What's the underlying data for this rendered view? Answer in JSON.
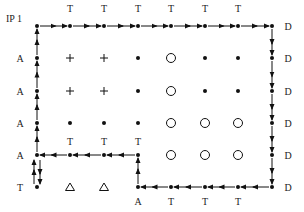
{
  "title_label": "IP 1",
  "grid": {
    "cols_x": [
      37,
      70,
      104,
      138,
      171,
      205,
      238,
      272
    ],
    "rows_y": [
      26,
      58,
      91,
      123,
      155,
      187
    ]
  },
  "colors": {
    "ink": "#111111",
    "background": "#ffffff"
  },
  "cells": [
    [
      "dot",
      "dot",
      "dot",
      "dot",
      "dot",
      "dot",
      "dot",
      "dot"
    ],
    [
      "dot",
      "plus",
      "plus",
      "dot",
      "circle",
      "dot",
      "dot",
      "dot"
    ],
    [
      "dot",
      "plus",
      "plus",
      "dot",
      "circle",
      "dot",
      "dot",
      "dot"
    ],
    [
      "dot",
      "dot",
      "dot",
      "dot",
      "circle",
      "circle",
      "circle",
      "dot"
    ],
    [
      "dot",
      "dot",
      "dot",
      "dot",
      "circle",
      "circle",
      "circle",
      "dot"
    ],
    [
      "dot",
      "triangle",
      "triangle",
      "dot",
      "dot",
      "dot",
      "dot",
      "dot"
    ]
  ],
  "labels": [
    {
      "text": "IP 1",
      "x": 6,
      "y": 22
    },
    {
      "text": "T",
      "x": 70,
      "y": 12
    },
    {
      "text": "T",
      "x": 104,
      "y": 12
    },
    {
      "text": "T",
      "x": 138,
      "y": 12
    },
    {
      "text": "T",
      "x": 171,
      "y": 12
    },
    {
      "text": "T",
      "x": 205,
      "y": 12
    },
    {
      "text": "T",
      "x": 238,
      "y": 12
    },
    {
      "text": "D",
      "x": 288,
      "y": 30
    },
    {
      "text": "D",
      "x": 288,
      "y": 62
    },
    {
      "text": "D",
      "x": 288,
      "y": 95
    },
    {
      "text": "D",
      "x": 288,
      "y": 127
    },
    {
      "text": "D",
      "x": 288,
      "y": 159
    },
    {
      "text": "D",
      "x": 288,
      "y": 191
    },
    {
      "text": "A",
      "x": 20,
      "y": 62
    },
    {
      "text": "A",
      "x": 20,
      "y": 95
    },
    {
      "text": "A",
      "x": 20,
      "y": 127
    },
    {
      "text": "A",
      "x": 20,
      "y": 159
    },
    {
      "text": "T",
      "x": 20,
      "y": 191
    },
    {
      "text": "T",
      "x": 70,
      "y": 145
    },
    {
      "text": "T",
      "x": 104,
      "y": 145
    },
    {
      "text": "T",
      "x": 138,
      "y": 145
    },
    {
      "text": "A",
      "x": 138,
      "y": 205
    },
    {
      "text": "T",
      "x": 171,
      "y": 205
    },
    {
      "text": "T",
      "x": 205,
      "y": 205
    },
    {
      "text": "T",
      "x": 238,
      "y": 205
    }
  ],
  "arrows": [
    {
      "from": [
        37,
        123
      ],
      "to": [
        37,
        91
      ]
    },
    {
      "from": [
        37,
        91
      ],
      "to": [
        37,
        58
      ]
    },
    {
      "from": [
        37,
        58
      ],
      "to": [
        37,
        26
      ]
    },
    {
      "from": [
        37,
        155
      ],
      "to": [
        37,
        123
      ]
    },
    {
      "from": [
        37,
        26
      ],
      "to": [
        70,
        26
      ]
    },
    {
      "from": [
        70,
        26
      ],
      "to": [
        104,
        26
      ]
    },
    {
      "from": [
        104,
        26
      ],
      "to": [
        138,
        26
      ]
    },
    {
      "from": [
        138,
        26
      ],
      "to": [
        171,
        26
      ]
    },
    {
      "from": [
        171,
        26
      ],
      "to": [
        205,
        26
      ]
    },
    {
      "from": [
        205,
        26
      ],
      "to": [
        238,
        26
      ]
    },
    {
      "from": [
        238,
        26
      ],
      "to": [
        272,
        26
      ]
    },
    {
      "from": [
        272,
        26
      ],
      "to": [
        272,
        58
      ]
    },
    {
      "from": [
        272,
        58
      ],
      "to": [
        272,
        91
      ]
    },
    {
      "from": [
        272,
        91
      ],
      "to": [
        272,
        123
      ]
    },
    {
      "from": [
        272,
        123
      ],
      "to": [
        272,
        155
      ]
    },
    {
      "from": [
        272,
        155
      ],
      "to": [
        272,
        187
      ]
    },
    {
      "from": [
        272,
        187
      ],
      "to": [
        238,
        187
      ]
    },
    {
      "from": [
        238,
        187
      ],
      "to": [
        205,
        187
      ]
    },
    {
      "from": [
        205,
        187
      ],
      "to": [
        171,
        187
      ]
    },
    {
      "from": [
        171,
        187
      ],
      "to": [
        138,
        187
      ]
    },
    {
      "from": [
        138,
        187
      ],
      "to": [
        138,
        155
      ]
    },
    {
      "from": [
        138,
        155
      ],
      "to": [
        104,
        155
      ]
    },
    {
      "from": [
        104,
        155
      ],
      "to": [
        70,
        155
      ]
    },
    {
      "from": [
        70,
        155
      ],
      "to": [
        37,
        155
      ]
    },
    {
      "from": [
        34,
        187
      ],
      "to": [
        34,
        157
      ]
    },
    {
      "from": [
        40,
        157
      ],
      "to": [
        40,
        187
      ]
    }
  ]
}
